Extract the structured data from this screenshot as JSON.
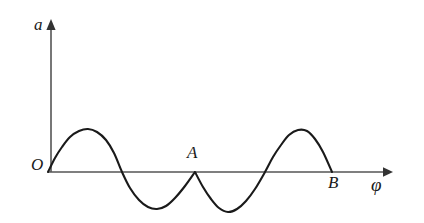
{
  "figure": {
    "title": "",
    "background_color": "#ffffff",
    "stroke_color": "#1a1a1a",
    "axis_color": "#4d4d4d"
  },
  "labels": {
    "y_axis": "a",
    "x_axis": "φ",
    "origin": "O",
    "point_a": "A",
    "point_b": "B"
  },
  "chart_data": {
    "type": "line",
    "title": "",
    "xlabel": "φ",
    "ylabel": "a",
    "grid": false,
    "legend": null,
    "axes": {
      "origin_label": "O",
      "x_axis_arrow": true,
      "y_axis_arrow": true,
      "x_range_px": [
        48,
        392
      ],
      "y_baseline_px": 172,
      "y_axis_top_px": 20,
      "tick_labels_x": [],
      "tick_labels_y": []
    },
    "annotations": [
      {
        "label": "O",
        "x": 0,
        "y": 0,
        "note": "origin, curve start on axis"
      },
      {
        "label": "A",
        "x": 1,
        "y": 0,
        "note": "cusp where curve touches axis with a sharp point"
      },
      {
        "label": "B",
        "x": 2,
        "y": 0,
        "note": "curve end on axis"
      }
    ],
    "series": [
      {
        "name": "a(φ)",
        "points_px": [
          [
            48,
            172
          ],
          [
            55,
            158
          ],
          [
            62,
            147
          ],
          [
            70,
            137
          ],
          [
            79,
            131
          ],
          [
            88,
            129
          ],
          [
            97,
            132
          ],
          [
            106,
            140
          ],
          [
            114,
            153
          ],
          [
            122,
            172
          ],
          [
            130,
            188
          ],
          [
            139,
            200
          ],
          [
            148,
            207
          ],
          [
            157,
            209
          ],
          [
            166,
            206
          ],
          [
            175,
            198
          ],
          [
            185,
            186
          ],
          [
            195,
            172
          ],
          [
            203,
            187
          ],
          [
            211,
            199
          ],
          [
            219,
            208
          ],
          [
            228,
            212
          ],
          [
            237,
            209
          ],
          [
            246,
            201
          ],
          [
            255,
            189
          ],
          [
            265,
            172
          ],
          [
            273,
            157
          ],
          [
            281,
            145
          ],
          [
            289,
            135
          ],
          [
            298,
            130
          ],
          [
            307,
            131
          ],
          [
            315,
            139
          ],
          [
            323,
            152
          ],
          [
            332,
            172
          ]
        ],
        "key_points": {
          "start_O": [
            48,
            172
          ],
          "crest_1": [
            88,
            129
          ],
          "zero_crossing_1": [
            122,
            172
          ],
          "trough_1": [
            157,
            209
          ],
          "cusp_A": [
            195,
            172
          ],
          "trough_2": [
            228,
            212
          ],
          "zero_crossing_2": [
            265,
            172
          ],
          "crest_2": [
            298,
            130
          ],
          "end_B": [
            332,
            172
          ]
        },
        "amplitude_px": 42,
        "values_normalized": {
          "x": [
            0,
            0.25,
            0.5,
            0.75,
            1.0,
            1.25,
            1.5,
            1.75,
            2.0
          ],
          "y": [
            0,
            1,
            0,
            -1,
            0,
            -1,
            0,
            1,
            0
          ]
        }
      }
    ]
  }
}
